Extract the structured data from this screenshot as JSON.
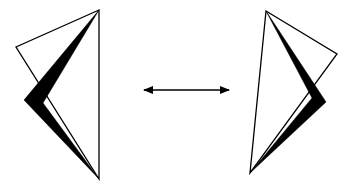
{
  "diagram": {
    "type": "mirror-reflection",
    "colors": {
      "background": "#ffffff",
      "stroke": "#000000",
      "fill": "#000000"
    },
    "left_shape": {
      "outline_points": "99,10 16,47 99,179",
      "filled_points": "99,10 24,100 99,179 43,103"
    },
    "right_shape": {
      "outline_points": "266,11 337,54 250,173",
      "filled_points": "266,11 326,102 250,173 312,98"
    },
    "arrow": {
      "x1": 144,
      "y1": 90,
      "x2": 229,
      "y2": 90,
      "direction": "bidirectional"
    }
  }
}
